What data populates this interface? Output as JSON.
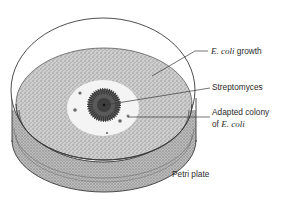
{
  "figure": {
    "type": "labeled illustration",
    "colors": {
      "background": "#ffffff",
      "outline": "#3a3a3a",
      "stipple": "#9a9a9a",
      "clear_zone": "#f2f2f2",
      "colony": "#4a4a4a",
      "leader_line": "#3a3a3a"
    }
  },
  "labels": {
    "ecoli_growth": {
      "italic": "E. coli",
      "plain": " growth"
    },
    "streptomyces": "Streptomyces",
    "adapted_colony": {
      "line1": "Adapted colony",
      "line2_plain": "of ",
      "line2_italic": "E. coli"
    },
    "petri_plate": "Petri plate"
  }
}
